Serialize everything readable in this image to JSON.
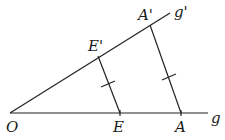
{
  "diagram": {
    "type": "intercept-theorem",
    "labels": {
      "origin": "O",
      "E": "E",
      "A": "A",
      "E_prime": "E'",
      "A_prime": "A'",
      "ray_g": "g",
      "ray_g_prime": "g'"
    },
    "points": {
      "O": [
        10,
        113
      ],
      "E": [
        120,
        113
      ],
      "A": [
        181,
        113
      ],
      "E_prime": [
        98,
        56
      ],
      "A_prime": [
        150,
        25
      ]
    },
    "rays": [
      {
        "name": "g",
        "from": "O",
        "to": [
          208,
          113
        ]
      },
      {
        "name": "g'",
        "from": "O",
        "to": [
          170,
          13
        ]
      }
    ],
    "parallels": [
      {
        "from": "E",
        "to": "E_prime",
        "tick": true
      },
      {
        "from": "A",
        "to": "A_prime",
        "tick": true
      }
    ],
    "stroke_color": "#222222"
  }
}
